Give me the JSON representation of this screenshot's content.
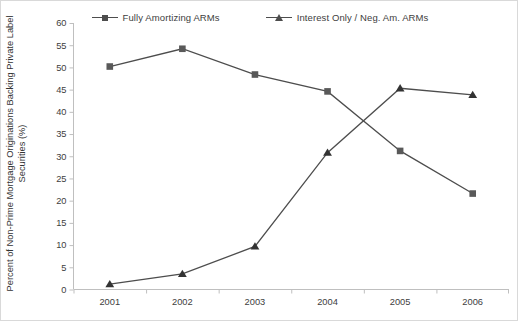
{
  "chart_data": {
    "type": "line",
    "title": "",
    "xlabel": "",
    "ylabel": "Percent of Non-Prime Mortgage Originations Backing Private Label Securities (%)",
    "categories": [
      "2001",
      "2002",
      "2003",
      "2004",
      "2005",
      "2006"
    ],
    "series": [
      {
        "name": "Fully Amortizing ARMs",
        "marker": "square",
        "color": "#595959",
        "values": [
          50.2,
          54.2,
          48.4,
          44.6,
          31.2,
          21.6
        ]
      },
      {
        "name": "Interest Only / Neg. Am. ARMs",
        "marker": "triangle",
        "color": "#333333",
        "values": [
          1.2,
          3.5,
          9.7,
          30.8,
          45.3,
          43.8
        ]
      }
    ],
    "ylim": [
      0,
      60
    ],
    "ytick_step": 5,
    "yticks": [
      "0",
      "5",
      "10",
      "15",
      "20",
      "25",
      "30",
      "35",
      "40",
      "45",
      "50",
      "55",
      "60"
    ],
    "grid": false,
    "legend_position": "top-center"
  },
  "legend": {
    "entries": [
      {
        "label": "Fully Amortizing ARMs"
      },
      {
        "label": "Interest Only / Neg. Am. ARMs"
      }
    ]
  },
  "axes": {
    "y_title": "Percent of Non-Prime Mortgage Originations Backing Private Label Securities (%)"
  },
  "colors": {
    "series_1": "#595959",
    "series_2": "#333333",
    "axis": "#bfbfbf",
    "text": "#404040",
    "background": "#ffffff",
    "border": "#d9d9d9"
  }
}
